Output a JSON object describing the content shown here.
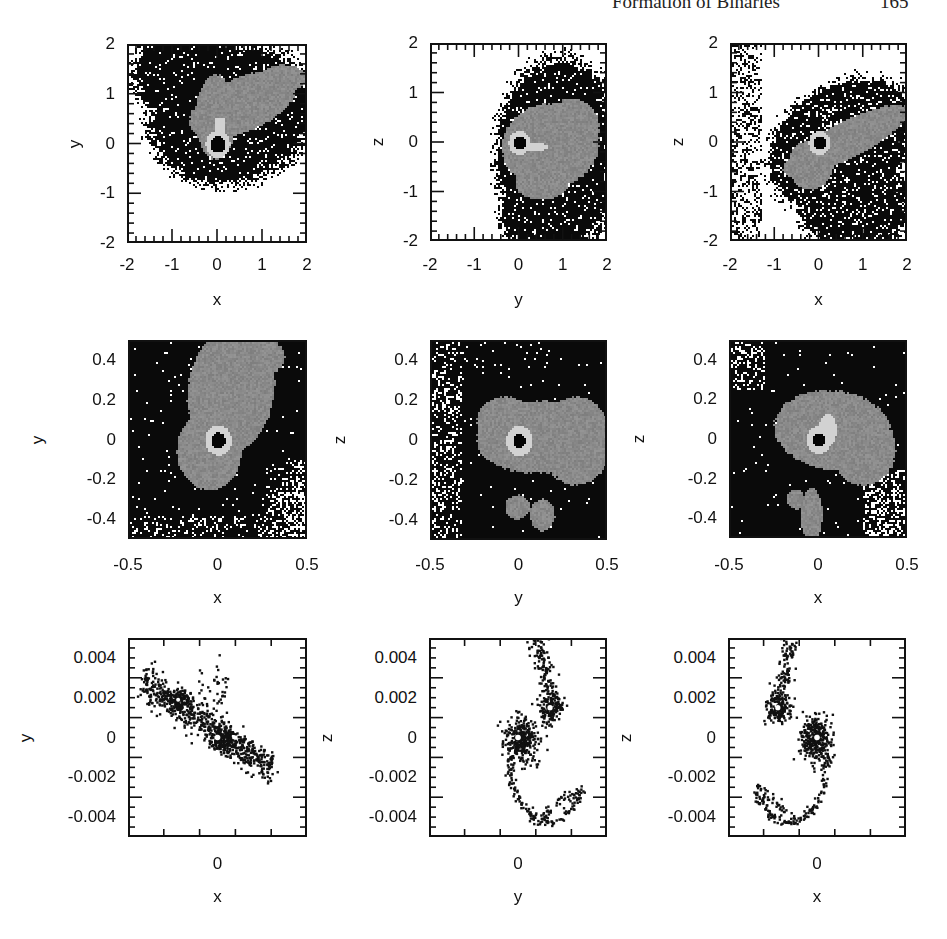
{
  "page": {
    "running_head": "Formation of Binaries",
    "page_number": "165"
  },
  "colors": {
    "frame": "#111111",
    "dense_black": "#0a0a0a",
    "mid_gray": "#8a8a8a",
    "light_ring": "#d2d2d2",
    "background": "#ffffff"
  },
  "chart_data": [
    {
      "type": "heatmap",
      "row": 1,
      "col": 1,
      "xlabel": "x",
      "ylabel": "y",
      "xlim": [
        -2,
        2
      ],
      "ylim": [
        -2,
        2
      ],
      "xticks": [
        "-2",
        "-1",
        "0",
        "1",
        "2"
      ],
      "yticks": [
        "2",
        "1",
        "0",
        "-1",
        "-2"
      ],
      "description": "Projected density: gray envelope extending up-right from core at (0,0); black outer halo; light ring around black core"
    },
    {
      "type": "heatmap",
      "row": 1,
      "col": 2,
      "xlabel": "y",
      "ylabel": "z",
      "xlim": [
        -2,
        2
      ],
      "ylim": [
        -2,
        2
      ],
      "xticks": [
        "-2",
        "-1",
        "0",
        "1",
        "2"
      ],
      "yticks": [
        "2",
        "1",
        "0",
        "-1",
        "-2"
      ],
      "description": "Gray envelope spanning y from ~-0.5 to 1.8, core at (0,0) with light ring"
    },
    {
      "type": "heatmap",
      "row": 1,
      "col": 3,
      "xlabel": "x",
      "ylabel": "z",
      "xlim": [
        -2,
        2
      ],
      "ylim": [
        -2,
        2
      ],
      "xticks": [
        "-2",
        "-1",
        "0",
        "1",
        "2"
      ],
      "yticks": [
        "2",
        "1",
        "0",
        "-1",
        "-2"
      ],
      "description": "Elongated gray band tilted from lower-left (-0.5,-1) to upper-right (2,0.6); core at (0,0)"
    },
    {
      "type": "heatmap",
      "row": 2,
      "col": 1,
      "xlabel": "x",
      "ylabel": "y",
      "xlim": [
        -0.5,
        0.5
      ],
      "ylim": [
        -0.5,
        0.5
      ],
      "xticks": [
        "-0.5",
        "0",
        "0.5"
      ],
      "yticks": [
        "0.4",
        "0.2",
        "0",
        "-0.2",
        "-0.4"
      ],
      "description": "Zoomed: gray lobe extending upward from core; light ring radius ~0.06 around black core"
    },
    {
      "type": "heatmap",
      "row": 2,
      "col": 2,
      "xlabel": "y",
      "ylabel": "z",
      "xlim": [
        -0.5,
        0.5
      ],
      "ylim": [
        -0.5,
        0.5
      ],
      "xticks": [
        "-0.5",
        "0",
        "0.5"
      ],
      "yticks": [
        "0.4",
        "0.2",
        "0",
        "-0.2",
        "-0.4"
      ],
      "description": "Gray blob from y=-0.25 to 0.5, z=-0.2 to 0.25; two small gray clumps near (0,-0.35) and (0.13,-0.37)"
    },
    {
      "type": "heatmap",
      "row": 2,
      "col": 3,
      "xlabel": "x",
      "ylabel": "z",
      "xlim": [
        -0.5,
        0.5
      ],
      "ylim": [
        -0.5,
        0.5
      ],
      "xticks": [
        "-0.5",
        "0",
        "0.5"
      ],
      "yticks": [
        "0.4",
        "0.2",
        "0",
        "-0.2",
        "-0.4"
      ],
      "description": "Gray blob from x=-0.25 to 0.42; gray column extending downward near x~-0.05 at z<-0.25"
    },
    {
      "type": "scatter",
      "row": 3,
      "col": 1,
      "xlabel": "x",
      "ylabel": "y",
      "xlim": [
        -0.005,
        0.005
      ],
      "ylim": [
        -0.005,
        0.005
      ],
      "xticks": [
        "0"
      ],
      "yticks": [
        "0.004",
        "0.002",
        "0",
        "-0.002",
        "-0.004"
      ],
      "description": "Particles in elongated band from (-0.004,0.003) to (0.003,-0.0015); two concentrations at (-0.0022,0.0018) and (0,0)"
    },
    {
      "type": "scatter",
      "row": 3,
      "col": 2,
      "xlabel": "y",
      "ylabel": "z",
      "xlim": [
        -0.005,
        0.005
      ],
      "ylim": [
        -0.005,
        0.005
      ],
      "xticks": [
        "0"
      ],
      "yticks": [
        "0.004",
        "0.002",
        "0",
        "-0.002",
        "-0.004"
      ],
      "description": "Binary: primary clump at (0,0), secondary at (0.0018,0.0015); spiral arm tails to top and bottom"
    },
    {
      "type": "scatter",
      "row": 3,
      "col": 3,
      "xlabel": "x",
      "ylabel": "z",
      "xlim": [
        -0.005,
        0.005
      ],
      "ylim": [
        -0.005,
        0.005
      ],
      "xticks": [
        "0"
      ],
      "yticks": [
        "0.004",
        "0.002",
        "0",
        "-0.002",
        "-0.004"
      ],
      "description": "Binary: primary clump at (0,0), secondary at (-0.0022,0.0015); spiral arm tails up-left and down"
    }
  ]
}
